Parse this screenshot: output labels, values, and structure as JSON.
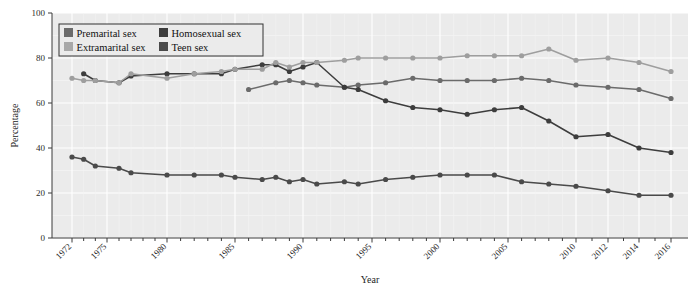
{
  "chart_data": {
    "type": "line",
    "title": "",
    "xlabel": "Year",
    "ylabel": "Percentage",
    "xlim": [
      1971,
      2017
    ],
    "ylim": [
      0,
      100
    ],
    "yticks": [
      0,
      20,
      40,
      60,
      80,
      100
    ],
    "xticks": [
      1972,
      1975,
      1980,
      1985,
      1990,
      1995,
      2000,
      2005,
      2010,
      2012,
      2014,
      2016
    ],
    "grid": true,
    "legend_position": "top-left",
    "series": [
      {
        "name": "Premarital sex",
        "color": "#6b6b6b",
        "x": [
          1986,
          1988,
          1989,
          1990,
          1991,
          1993,
          1994,
          1996,
          1998,
          2000,
          2002,
          2004,
          2006,
          2008,
          2010,
          2012,
          2014,
          2016
        ],
        "values": [
          66,
          69,
          70,
          69,
          68,
          67,
          68,
          69,
          71,
          70,
          70,
          70,
          71,
          70,
          68,
          67,
          66,
          62
        ]
      },
      {
        "name": "Extramarital sex",
        "color": "#4a4a4a",
        "x": [
          1972,
          1973,
          1974,
          1976,
          1977,
          1980,
          1982,
          1984,
          1985,
          1987,
          1988,
          1989,
          1990,
          1991,
          1993,
          1994,
          1996,
          1998,
          2000,
          2002,
          2004,
          2006,
          2008,
          2010,
          2012,
          2014,
          2016
        ],
        "values": [
          36,
          35,
          32,
          31,
          29,
          28,
          28,
          28,
          27,
          26,
          27,
          25,
          26,
          24,
          25,
          24,
          26,
          27,
          28,
          28,
          28,
          25,
          24,
          23,
          21,
          19,
          19
        ]
      },
      {
        "name": "Homosexual sex",
        "color": "#3d3d3d",
        "x": [
          1973,
          1974,
          1976,
          1977,
          1980,
          1982,
          1984,
          1985,
          1987,
          1988,
          1989,
          1990,
          1991,
          1993,
          1994,
          1996,
          1998,
          2000,
          2002,
          2004,
          2006,
          2008,
          2010,
          2012,
          2014,
          2016
        ],
        "values": [
          73,
          70,
          69,
          72,
          73,
          73,
          73,
          75,
          77,
          77,
          74,
          76,
          78,
          67,
          66,
          61,
          58,
          57,
          55,
          57,
          58,
          52,
          45,
          46,
          40,
          38
        ]
      },
      {
        "name": "Teen sex",
        "color": "#9e9e9e",
        "x": [
          1972,
          1973,
          1974,
          1976,
          1977,
          1980,
          1982,
          1984,
          1985,
          1987,
          1988,
          1989,
          1990,
          1991,
          1993,
          1994,
          1996,
          1998,
          2000,
          2002,
          2004,
          2006,
          2008,
          2010,
          2012,
          2014,
          2016
        ],
        "values": [
          71,
          70,
          70,
          69,
          73,
          71,
          73,
          74,
          75,
          75,
          78,
          76,
          78,
          78,
          79,
          80,
          80,
          80,
          80,
          81,
          81,
          81,
          84,
          79,
          80,
          78,
          74
        ]
      }
    ]
  },
  "legend": {
    "entries": [
      {
        "label": "Premarital sex",
        "color": "#6b6b6b"
      },
      {
        "label": "Homosexual sex",
        "color": "#3d3d3d"
      },
      {
        "label": "Extramarital sex",
        "color": "#a8a8a8"
      },
      {
        "label": "Teen sex",
        "color": "#4a4a4a"
      }
    ]
  },
  "axes": {
    "y_title": "Percentage",
    "x_title": "Year",
    "y_tick_labels": [
      "0",
      "20",
      "40",
      "60",
      "80",
      "100"
    ],
    "x_tick_labels": [
      "1972",
      "1975",
      "1980",
      "1985",
      "1990",
      "1995",
      "2000",
      "2005",
      "2010",
      "2012",
      "2014",
      "2016"
    ]
  }
}
